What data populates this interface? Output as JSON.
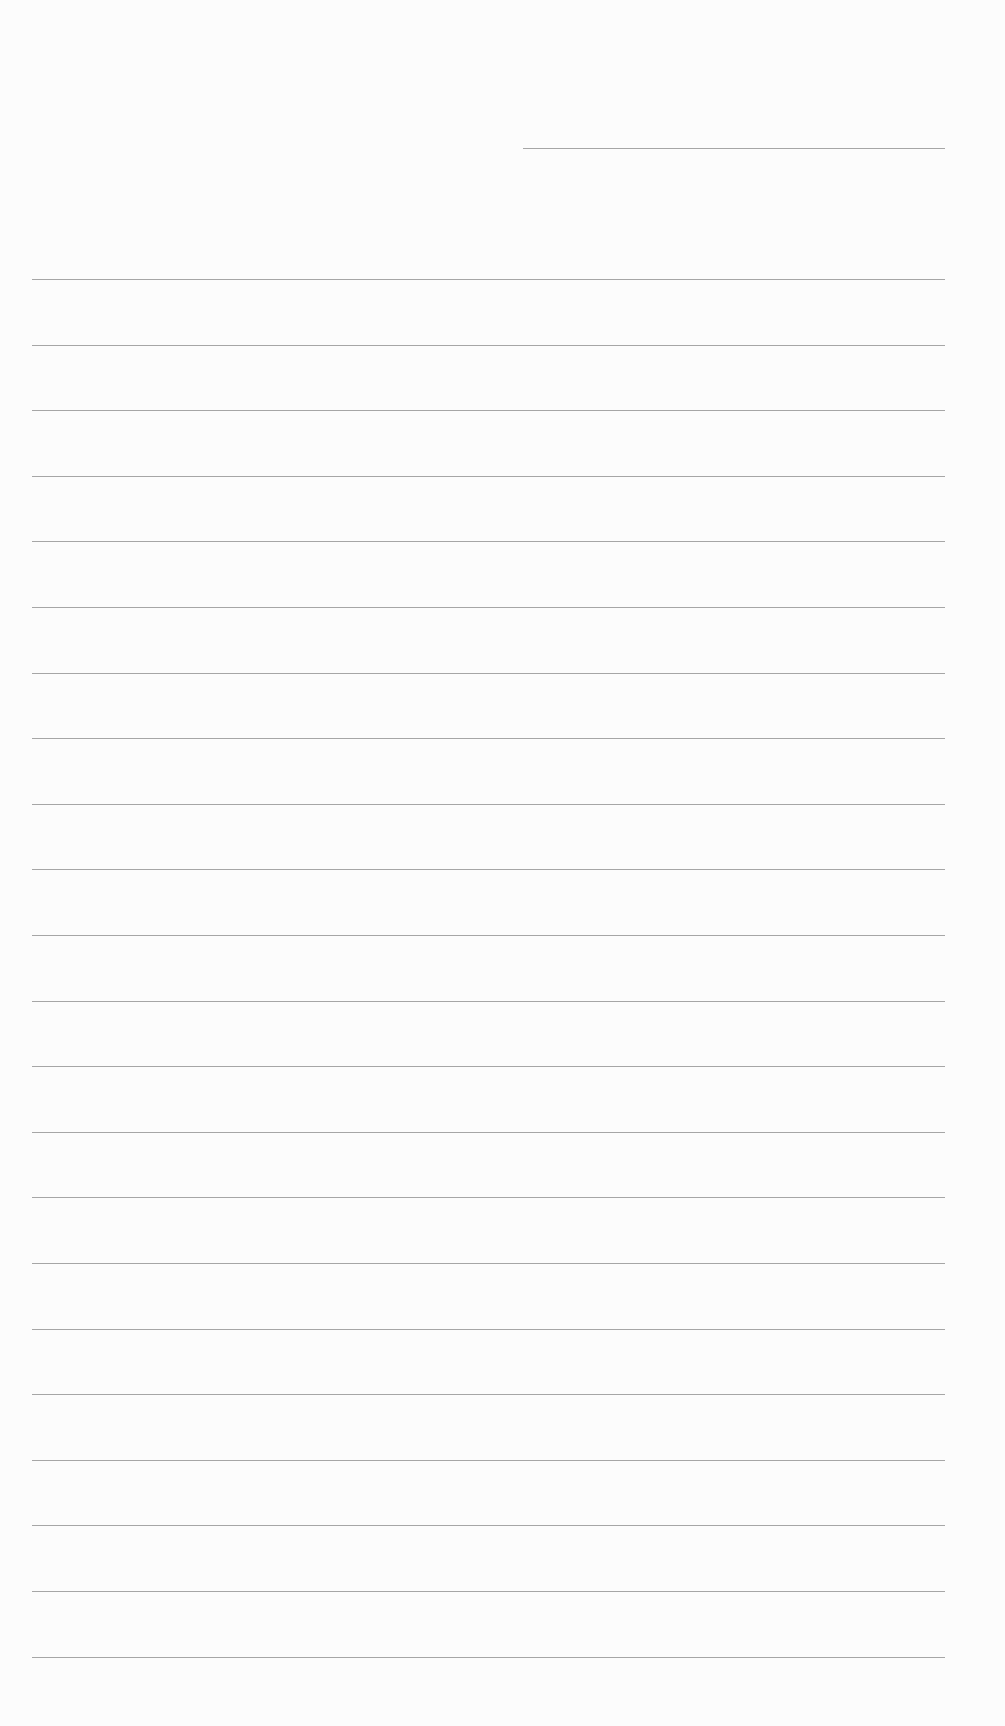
{
  "page": {
    "type": "ruled-paper",
    "background_color": "#fcfcfc",
    "rule_color": "#8a8a8a",
    "header_line": {
      "x_start": 523,
      "x_end": 945,
      "y": 148
    },
    "rules": {
      "x_start": 32,
      "x_end": 945,
      "y_first": 279,
      "spacing": 65.6,
      "count": 22
    }
  }
}
